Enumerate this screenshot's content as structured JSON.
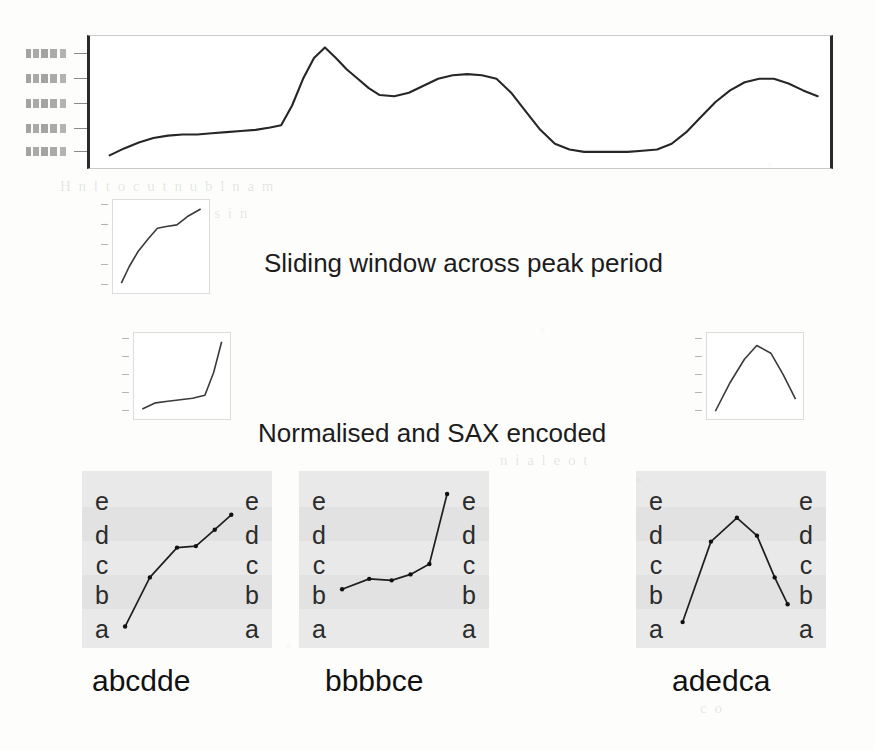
{
  "figure": {
    "captions": [
      {
        "id": "sliding-window",
        "text": "Sliding window across peak period"
      },
      {
        "id": "normalised-sax",
        "text": "Normalised and SAX encoded"
      }
    ]
  },
  "chart_data": [
    {
      "id": "main-series",
      "type": "line",
      "title": "",
      "xlabel": "",
      "ylabel": "",
      "grid": false,
      "legend": false,
      "axis_tick_labels_y": [
        "",
        "",
        "",
        "",
        ""
      ],
      "axis_tick_labels_legible": false,
      "ylim": [
        0,
        1
      ],
      "xlim": [
        0,
        1
      ],
      "x": [
        0.02,
        0.04,
        0.06,
        0.08,
        0.1,
        0.12,
        0.14,
        0.16,
        0.18,
        0.2,
        0.22,
        0.24,
        0.255,
        0.27,
        0.285,
        0.3,
        0.315,
        0.33,
        0.345,
        0.36,
        0.375,
        0.39,
        0.41,
        0.43,
        0.45,
        0.47,
        0.49,
        0.51,
        0.53,
        0.55,
        0.57,
        0.59,
        0.61,
        0.63,
        0.65,
        0.67,
        0.69,
        0.71,
        0.73,
        0.75,
        0.77,
        0.79,
        0.81,
        0.83,
        0.85,
        0.87,
        0.89,
        0.91,
        0.93,
        0.95,
        0.97,
        0.99
      ],
      "values": [
        0.04,
        0.1,
        0.15,
        0.19,
        0.21,
        0.22,
        0.22,
        0.23,
        0.24,
        0.25,
        0.26,
        0.28,
        0.3,
        0.47,
        0.7,
        0.88,
        0.97,
        0.88,
        0.78,
        0.7,
        0.62,
        0.56,
        0.55,
        0.58,
        0.64,
        0.7,
        0.73,
        0.74,
        0.73,
        0.7,
        0.58,
        0.42,
        0.26,
        0.14,
        0.09,
        0.07,
        0.07,
        0.07,
        0.07,
        0.08,
        0.09,
        0.14,
        0.24,
        0.37,
        0.5,
        0.6,
        0.67,
        0.7,
        0.7,
        0.66,
        0.6,
        0.55
      ]
    },
    {
      "id": "window-1",
      "type": "line",
      "title": "",
      "grid": false,
      "legend": false,
      "ylim": [
        0,
        1
      ],
      "x": [
        0.05,
        0.14,
        0.24,
        0.36,
        0.46,
        0.56,
        0.68,
        0.8,
        0.95
      ],
      "values": [
        0.06,
        0.26,
        0.44,
        0.6,
        0.72,
        0.74,
        0.76,
        0.86,
        0.95
      ]
    },
    {
      "id": "window-2",
      "type": "line",
      "title": "",
      "grid": false,
      "legend": false,
      "ylim": [
        0,
        1
      ],
      "x": [
        0.05,
        0.2,
        0.34,
        0.48,
        0.62,
        0.76,
        0.86,
        0.95
      ],
      "values": [
        0.07,
        0.15,
        0.17,
        0.19,
        0.21,
        0.25,
        0.55,
        0.95
      ]
    },
    {
      "id": "window-3",
      "type": "line",
      "title": "",
      "grid": false,
      "legend": false,
      "ylim": [
        0,
        1
      ],
      "x": [
        0.05,
        0.22,
        0.38,
        0.52,
        0.68,
        0.82,
        0.96
      ],
      "values": [
        0.04,
        0.42,
        0.72,
        0.9,
        0.8,
        0.52,
        0.2
      ]
    }
  ],
  "sax": {
    "alphabet": [
      "e",
      "d",
      "c",
      "b",
      "a"
    ],
    "panels": [
      {
        "id": "sax-panel-1",
        "word": "abcdde",
        "letters_left": [
          "e",
          "d",
          "c",
          "b",
          "a"
        ],
        "letters_right": [
          "e",
          "d",
          "c",
          "b",
          "a"
        ],
        "points": [
          {
            "x": 0.06,
            "y": 0.05,
            "symbol": "a"
          },
          {
            "x": 0.27,
            "y": 0.38,
            "symbol": "b"
          },
          {
            "x": 0.5,
            "y": 0.58,
            "symbol": "c"
          },
          {
            "x": 0.66,
            "y": 0.59,
            "symbol": "d"
          },
          {
            "x": 0.82,
            "y": 0.7,
            "symbol": "d"
          },
          {
            "x": 0.96,
            "y": 0.8,
            "symbol": "e"
          }
        ]
      },
      {
        "id": "sax-panel-2",
        "word": "bbbbce",
        "letters_left": [
          "e",
          "d",
          "c",
          "b",
          "a"
        ],
        "letters_right": [
          "e",
          "d",
          "c",
          "b",
          "a"
        ],
        "points": [
          {
            "x": 0.06,
            "y": 0.3,
            "symbol": "b"
          },
          {
            "x": 0.29,
            "y": 0.37,
            "symbol": "b"
          },
          {
            "x": 0.48,
            "y": 0.36,
            "symbol": "b"
          },
          {
            "x": 0.64,
            "y": 0.4,
            "symbol": "b"
          },
          {
            "x": 0.8,
            "y": 0.47,
            "symbol": "c"
          },
          {
            "x": 0.95,
            "y": 0.94,
            "symbol": "e"
          }
        ]
      },
      {
        "id": "sax-panel-3",
        "word": "adedca",
        "letters_left": [
          "e",
          "d",
          "c",
          "b",
          "a"
        ],
        "letters_right": [
          "e",
          "d",
          "c",
          "b",
          "a"
        ],
        "points": [
          {
            "x": 0.09,
            "y": 0.08,
            "symbol": "a"
          },
          {
            "x": 0.33,
            "y": 0.62,
            "symbol": "d"
          },
          {
            "x": 0.55,
            "y": 0.78,
            "symbol": "e"
          },
          {
            "x": 0.72,
            "y": 0.66,
            "symbol": "d"
          },
          {
            "x": 0.87,
            "y": 0.38,
            "symbol": "c"
          },
          {
            "x": 0.98,
            "y": 0.2,
            "symbol": "a"
          }
        ]
      }
    ]
  }
}
